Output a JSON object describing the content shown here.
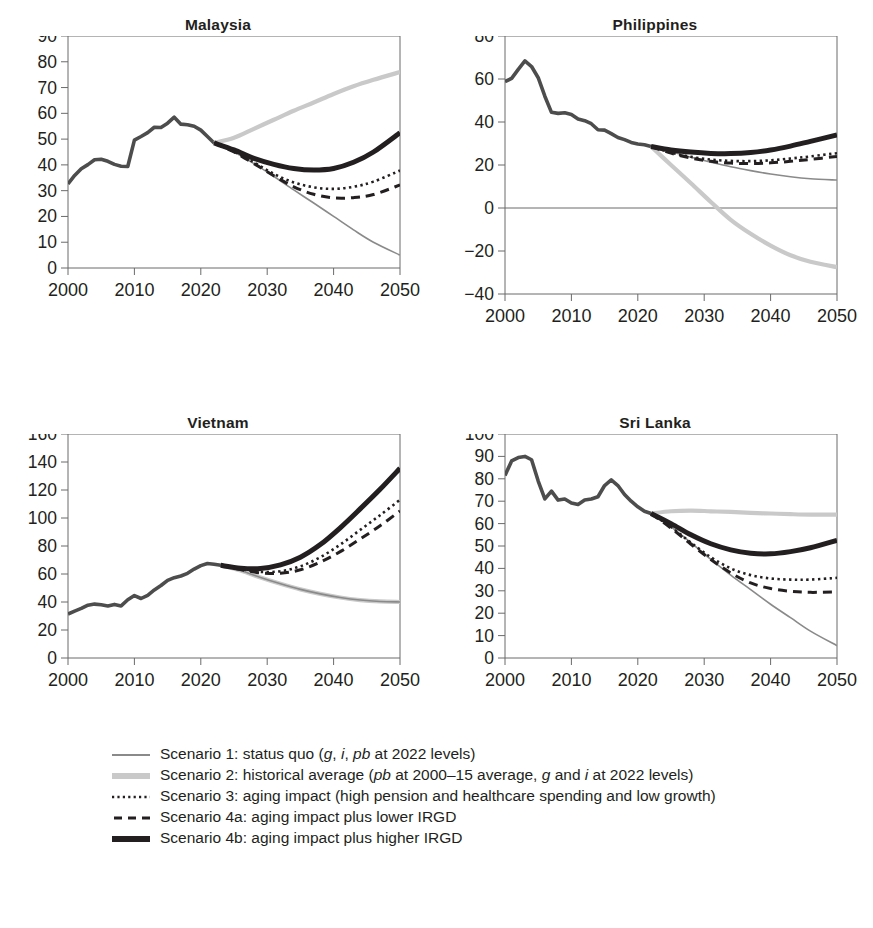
{
  "figure": {
    "panel_order": [
      "malaysia",
      "philippines",
      "vietnam",
      "sri_lanka"
    ]
  },
  "colors": {
    "scenario1": "#8a8a8a",
    "scenario2": "#c9c9c9",
    "scenario3": "#231f20",
    "scenario4a": "#231f20",
    "scenario4b": "#231f20",
    "history": "#4d4d4d",
    "axis": "#6b6b6b",
    "text": "#231f20",
    "background": "#ffffff"
  },
  "legend": {
    "items": [
      {
        "key": "scenario1",
        "style": "thin-solid-gray",
        "text_plain": "Scenario 1: status quo (g, i, pb at 2022 levels)",
        "parts": [
          {
            "t": "Scenario 1: status quo (",
            "i": false
          },
          {
            "t": "g",
            "i": true
          },
          {
            "t": ", ",
            "i": false
          },
          {
            "t": "i",
            "i": true
          },
          {
            "t": ", ",
            "i": false
          },
          {
            "t": "pb",
            "i": true
          },
          {
            "t": " at 2022 levels)",
            "i": false
          }
        ]
      },
      {
        "key": "scenario2",
        "style": "thick-solid-lightgray",
        "text_plain": "Scenario 2: historical average (pb at 2000–15 average, g and i at 2022 levels)",
        "parts": [
          {
            "t": "Scenario 2: historical average (",
            "i": false
          },
          {
            "t": "pb",
            "i": true
          },
          {
            "t": " at 2000–15 average, ",
            "i": false
          },
          {
            "t": "g",
            "i": true
          },
          {
            "t": " and ",
            "i": false
          },
          {
            "t": "i",
            "i": true
          },
          {
            "t": " at 2022 levels)",
            "i": false
          }
        ]
      },
      {
        "key": "scenario3",
        "style": "dotted-black",
        "text_plain": "Scenario 3: aging impact (high pension and healthcare spending and low growth)",
        "parts": [
          {
            "t": "Scenario 3: aging impact (high pension and healthcare spending and low growth)",
            "i": false
          }
        ]
      },
      {
        "key": "scenario4a",
        "style": "dashed-black",
        "text_plain": "Scenario 4a: aging impact plus lower IRGD",
        "parts": [
          {
            "t": "Scenario 4a: aging impact plus lower IRGD",
            "i": false
          }
        ]
      },
      {
        "key": "scenario4b",
        "style": "thick-solid-black",
        "text_plain": "Scenario 4b: aging impact plus higher IRGD",
        "parts": [
          {
            "t": "Scenario 4b: aging impact plus higher IRGD",
            "i": false
          }
        ]
      }
    ]
  },
  "chart_data": [
    {
      "id": "malaysia",
      "type": "line",
      "title": "Malaysia",
      "xlabel": "",
      "ylabel": "",
      "xlim": [
        2000,
        2050
      ],
      "ylim": [
        0,
        90
      ],
      "yticks": [
        0,
        10,
        20,
        30,
        40,
        50,
        60,
        70,
        80,
        90
      ],
      "xticks": [
        2000,
        2010,
        2020,
        2030,
        2040,
        2050
      ],
      "grid": false,
      "legend_position": "below-figure",
      "zero_line": false,
      "history_end": 2022,
      "history": {
        "x": [
          2000,
          2001,
          2002,
          2003,
          2004,
          2005,
          2006,
          2007,
          2008,
          2009,
          2010,
          2011,
          2012,
          2013,
          2014,
          2015,
          2016,
          2017,
          2018,
          2019,
          2020,
          2021,
          2022
        ],
        "y": [
          32.6,
          35.9,
          38.5,
          40.1,
          42.0,
          42.2,
          41.4,
          40.2,
          39.5,
          39.4,
          49.6,
          51.0,
          52.5,
          54.6,
          54.5,
          56.2,
          58.5,
          55.8,
          55.6,
          55.0,
          53.5,
          51.0,
          48.5
        ]
      },
      "series": [
        {
          "name": "Scenario 1",
          "key": "scenario1",
          "x": [
            2022,
            2025,
            2028,
            2031,
            2034,
            2037,
            2040,
            2043,
            2046,
            2050
          ],
          "y": [
            48.5,
            45.0,
            40.5,
            35.5,
            30.3,
            25.2,
            20.0,
            14.8,
            10.0,
            5.0
          ]
        },
        {
          "name": "Scenario 2",
          "key": "scenario2",
          "x": [
            2022,
            2025,
            2028,
            2031,
            2034,
            2037,
            2040,
            2043,
            2046,
            2050
          ],
          "y": [
            48.5,
            50.5,
            54.0,
            57.5,
            61.0,
            64.2,
            67.5,
            70.5,
            73.0,
            76.0
          ]
        },
        {
          "name": "Scenario 3",
          "key": "scenario3",
          "x": [
            2022,
            2025,
            2028,
            2031,
            2034,
            2037,
            2040,
            2043,
            2046,
            2050
          ],
          "y": [
            48.5,
            45.2,
            41.0,
            36.5,
            33.2,
            31.3,
            30.7,
            31.5,
            33.5,
            37.8
          ]
        },
        {
          "name": "Scenario 4a",
          "key": "scenario4a",
          "x": [
            2022,
            2025,
            2028,
            2031,
            2034,
            2037,
            2040,
            2043,
            2046,
            2050
          ],
          "y": [
            48.5,
            45.0,
            40.5,
            35.8,
            31.5,
            28.6,
            27.2,
            27.3,
            28.5,
            32.2
          ]
        },
        {
          "name": "Scenario 4b",
          "key": "scenario4b",
          "x": [
            2022,
            2025,
            2028,
            2031,
            2034,
            2037,
            2040,
            2043,
            2046,
            2050
          ],
          "y": [
            48.5,
            45.8,
            42.5,
            40.2,
            38.6,
            38.0,
            38.6,
            41.0,
            45.0,
            52.5
          ]
        }
      ]
    },
    {
      "id": "philippines",
      "type": "line",
      "title": "Philippines",
      "xlabel": "",
      "ylabel": "",
      "xlim": [
        2000,
        2050
      ],
      "ylim": [
        -40,
        80
      ],
      "yticks": [
        -40,
        -20,
        0,
        20,
        40,
        60,
        80
      ],
      "xticks": [
        2000,
        2010,
        2020,
        2030,
        2040,
        2050
      ],
      "grid": false,
      "legend_position": "below-figure",
      "zero_line": true,
      "history_end": 2022,
      "history": {
        "x": [
          2000,
          2001,
          2002,
          2003,
          2004,
          2005,
          2006,
          2007,
          2008,
          2009,
          2010,
          2011,
          2012,
          2013,
          2014,
          2015,
          2016,
          2017,
          2018,
          2019,
          2020,
          2021,
          2022
        ],
        "y": [
          58.8,
          60.3,
          64.5,
          68.4,
          65.8,
          60.6,
          52.0,
          44.5,
          44.0,
          44.3,
          43.5,
          41.4,
          40.6,
          39.2,
          36.4,
          36.2,
          34.6,
          32.8,
          31.8,
          30.5,
          29.8,
          29.4,
          28.6
        ]
      },
      "series": [
        {
          "name": "Scenario 1",
          "key": "scenario1",
          "x": [
            2022,
            2025,
            2028,
            2031,
            2034,
            2037,
            2040,
            2043,
            2046,
            2050
          ],
          "y": [
            28.6,
            26.2,
            23.6,
            21.3,
            19.2,
            17.4,
            15.8,
            14.5,
            13.6,
            13.0
          ]
        },
        {
          "name": "Scenario 2",
          "key": "scenario2",
          "x": [
            2022,
            2025,
            2028,
            2031,
            2034,
            2037,
            2040,
            2043,
            2046,
            2050
          ],
          "y": [
            28.6,
            20.0,
            11.5,
            2.8,
            -5.5,
            -12.0,
            -17.5,
            -22.0,
            -25.0,
            -27.5
          ]
        },
        {
          "name": "Scenario 3",
          "key": "scenario3",
          "x": [
            2022,
            2025,
            2028,
            2031,
            2034,
            2037,
            2040,
            2043,
            2046,
            2050
          ],
          "y": [
            28.6,
            25.8,
            23.8,
            22.5,
            21.9,
            21.8,
            22.2,
            23.0,
            24.0,
            25.5
          ]
        },
        {
          "name": "Scenario 4a",
          "key": "scenario4a",
          "x": [
            2022,
            2025,
            2028,
            2031,
            2034,
            2037,
            2040,
            2043,
            2046,
            2050
          ],
          "y": [
            28.6,
            25.5,
            23.2,
            21.7,
            20.9,
            20.7,
            21.0,
            21.7,
            22.6,
            24.0
          ]
        },
        {
          "name": "Scenario 4b",
          "key": "scenario4b",
          "x": [
            2022,
            2025,
            2028,
            2031,
            2034,
            2037,
            2040,
            2043,
            2046,
            2050
          ],
          "y": [
            28.6,
            27.0,
            26.0,
            25.4,
            25.3,
            25.8,
            27.0,
            28.8,
            31.0,
            34.0
          ]
        }
      ]
    },
    {
      "id": "vietnam",
      "type": "line",
      "title": "Vietnam",
      "xlabel": "",
      "ylabel": "",
      "xlim": [
        2000,
        2050
      ],
      "ylim": [
        0,
        160
      ],
      "yticks": [
        0,
        20,
        40,
        60,
        80,
        100,
        120,
        140,
        160
      ],
      "xticks": [
        2000,
        2010,
        2020,
        2030,
        2040,
        2050
      ],
      "grid": false,
      "legend_position": "below-figure",
      "zero_line": false,
      "history_end": 2023,
      "history": {
        "x": [
          2000,
          2001,
          2002,
          2003,
          2004,
          2005,
          2006,
          2007,
          2008,
          2009,
          2010,
          2011,
          2012,
          2013,
          2014,
          2015,
          2016,
          2017,
          2018,
          2019,
          2020,
          2021,
          2022,
          2023
        ],
        "y": [
          31.4,
          33.5,
          35.4,
          37.7,
          38.5,
          38.0,
          37.2,
          38.3,
          37.2,
          41.6,
          44.6,
          42.5,
          44.8,
          48.6,
          51.8,
          55.5,
          57.4,
          58.6,
          60.5,
          63.5,
          66.0,
          67.5,
          67.0,
          66.2
        ]
      },
      "series": [
        {
          "name": "Scenario 1",
          "key": "scenario1",
          "x": [
            2023,
            2026,
            2029,
            2032,
            2035,
            2038,
            2041,
            2044,
            2047,
            2050
          ],
          "y": [
            66.2,
            62.5,
            57.5,
            53.0,
            49.0,
            45.8,
            43.2,
            41.4,
            40.4,
            40.0
          ]
        },
        {
          "name": "Scenario 2",
          "key": "scenario2",
          "x": [
            2023,
            2026,
            2029,
            2032,
            2035,
            2038,
            2041,
            2044,
            2047,
            2050
          ],
          "y": [
            66.2,
            62.5,
            57.5,
            53.0,
            49.0,
            45.8,
            43.2,
            41.4,
            40.4,
            40.0
          ]
        },
        {
          "name": "Scenario 3",
          "key": "scenario3",
          "x": [
            2023,
            2026,
            2029,
            2032,
            2035,
            2038,
            2041,
            2044,
            2047,
            2050
          ],
          "y": [
            66.2,
            63.5,
            61.5,
            62.0,
            65.5,
            72.0,
            81.0,
            91.5,
            102.0,
            113.0
          ]
        },
        {
          "name": "Scenario 4a",
          "key": "scenario4a",
          "x": [
            2023,
            2026,
            2029,
            2032,
            2035,
            2038,
            2041,
            2044,
            2047,
            2050
          ],
          "y": [
            66.2,
            63.2,
            60.8,
            60.5,
            63.0,
            68.5,
            76.0,
            85.0,
            94.5,
            105.0
          ]
        },
        {
          "name": "Scenario 4b",
          "key": "scenario4b",
          "x": [
            2023,
            2026,
            2029,
            2032,
            2035,
            2038,
            2041,
            2044,
            2047,
            2050
          ],
          "y": [
            66.2,
            64.2,
            64.0,
            66.5,
            72.0,
            81.0,
            93.0,
            106.5,
            120.5,
            135.5
          ]
        }
      ]
    },
    {
      "id": "sri_lanka",
      "type": "line",
      "title": "Sri Lanka",
      "xlabel": "",
      "ylabel": "",
      "xlim": [
        2000,
        2050
      ],
      "ylim": [
        0,
        100
      ],
      "yticks": [
        0,
        10,
        20,
        30,
        40,
        50,
        60,
        70,
        80,
        90,
        100
      ],
      "xticks": [
        2000,
        2010,
        2020,
        2030,
        2040,
        2050
      ],
      "grid": false,
      "legend_position": "below-figure",
      "zero_line": false,
      "history_end": 2022,
      "history": {
        "x": [
          2000,
          2001,
          2002,
          2003,
          2004,
          2005,
          2006,
          2007,
          2008,
          2009,
          2010,
          2011,
          2012,
          2013,
          2014,
          2015,
          2016,
          2017,
          2018,
          2019,
          2020,
          2021,
          2022
        ],
        "y": [
          81.5,
          88.0,
          89.5,
          90.0,
          88.5,
          79.0,
          71.0,
          74.5,
          70.5,
          71.0,
          69.2,
          68.5,
          70.5,
          71.0,
          72.0,
          77.0,
          79.5,
          77.0,
          73.0,
          70.0,
          67.5,
          65.5,
          64.5
        ]
      },
      "series": [
        {
          "name": "Scenario 1",
          "key": "scenario1",
          "x": [
            2022,
            2025,
            2028,
            2031,
            2034,
            2037,
            2040,
            2043,
            2046,
            2050
          ],
          "y": [
            64.5,
            58.5,
            51.5,
            44.0,
            37.0,
            30.5,
            24.0,
            18.0,
            12.0,
            5.5
          ]
        },
        {
          "name": "Scenario 2",
          "key": "scenario2",
          "x": [
            2022,
            2025,
            2028,
            2031,
            2034,
            2037,
            2040,
            2043,
            2046,
            2050
          ],
          "y": [
            64.5,
            65.5,
            65.8,
            65.5,
            65.2,
            64.8,
            64.5,
            64.2,
            64.0,
            64.0
          ]
        },
        {
          "name": "Scenario 3",
          "key": "scenario3",
          "x": [
            2022,
            2025,
            2028,
            2031,
            2034,
            2037,
            2040,
            2043,
            2046,
            2050
          ],
          "y": [
            64.5,
            58.5,
            51.5,
            45.0,
            40.0,
            37.0,
            35.5,
            35.0,
            35.0,
            35.8
          ]
        },
        {
          "name": "Scenario 4a",
          "key": "scenario4a",
          "x": [
            2022,
            2025,
            2028,
            2031,
            2034,
            2037,
            2040,
            2043,
            2046,
            2050
          ],
          "y": [
            64.5,
            58.0,
            50.8,
            44.0,
            38.0,
            33.5,
            31.0,
            29.8,
            29.3,
            29.5
          ]
        },
        {
          "name": "Scenario 4b",
          "key": "scenario4b",
          "x": [
            2022,
            2025,
            2028,
            2031,
            2034,
            2037,
            2040,
            2043,
            2046,
            2050
          ],
          "y": [
            64.5,
            60.0,
            55.0,
            51.0,
            48.3,
            46.8,
            46.5,
            47.5,
            49.2,
            52.5
          ]
        }
      ]
    }
  ]
}
